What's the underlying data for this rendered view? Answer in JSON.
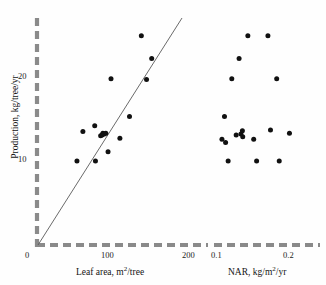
{
  "figure": {
    "background_color": "#fefefe",
    "axis_color": "#8a8a8a",
    "point_color": "#111111",
    "line_color": "#555555"
  },
  "yaxis": {
    "label_prefix": "Production, kg/tree/yr",
    "ticks": [
      {
        "value": 10,
        "label": "10"
      },
      {
        "value": 20,
        "label": "20"
      }
    ],
    "range": [
      0,
      27
    ]
  },
  "chart_data": [
    {
      "type": "scatter",
      "panel": "left",
      "title": "",
      "xlabel_text": "Leaf area, m",
      "xlabel_sup": "2",
      "xlabel_tail": "/tree",
      "xlabel": "Leaf area, m2/tree",
      "ylabel": "Production, kg/tree/yr",
      "xlim": [
        0,
        215
      ],
      "ylim": [
        0,
        27
      ],
      "xticks": [
        0,
        100,
        200
      ],
      "xtick_labels": [
        "0",
        "100",
        "200"
      ],
      "yticks": [
        10,
        20
      ],
      "ytick_labels": [
        "10",
        "20"
      ],
      "grid": false,
      "legend": "none",
      "fit_line": {
        "type": "line",
        "through_origin": true,
        "x0": 0,
        "y0": 0,
        "x1": 160,
        "y1": 26.5
      },
      "points": [
        {
          "x": 54,
          "y": 10.0
        },
        {
          "x": 62,
          "y": 13.5
        },
        {
          "x": 78,
          "y": 14.2
        },
        {
          "x": 79,
          "y": 10.0
        },
        {
          "x": 86,
          "y": 13.0
        },
        {
          "x": 88,
          "y": 13.1
        },
        {
          "x": 89,
          "y": 13.3
        },
        {
          "x": 91,
          "y": 13.2
        },
        {
          "x": 93,
          "y": 13.3
        },
        {
          "x": 96,
          "y": 11.1
        },
        {
          "x": 100,
          "y": 19.8
        },
        {
          "x": 112,
          "y": 12.7
        },
        {
          "x": 125,
          "y": 15.3
        },
        {
          "x": 141,
          "y": 24.9
        },
        {
          "x": 148,
          "y": 19.7
        },
        {
          "x": 155,
          "y": 22.2
        }
      ]
    },
    {
      "type": "scatter",
      "panel": "right",
      "title": "",
      "xlabel_text": "NAR, kg/m",
      "xlabel_sup": "2",
      "xlabel_tail": "/yr",
      "xlabel": "NAR, kg/m2/yr",
      "ylabel": "Production, kg/tree/yr",
      "xlim": [
        0.092,
        0.228
      ],
      "ylim": [
        0,
        27
      ],
      "xticks": [
        0.1,
        0.2
      ],
      "xtick_labels": [
        "0.1",
        "0.2"
      ],
      "yticks": [
        10,
        20
      ],
      "ytick_labels": [
        "10",
        "20"
      ],
      "grid": false,
      "legend": "none",
      "points": [
        {
          "x": 0.1095,
          "y": 12.6
        },
        {
          "x": 0.113,
          "y": 15.3
        },
        {
          "x": 0.1145,
          "y": 12.2
        },
        {
          "x": 0.118,
          "y": 10.0
        },
        {
          "x": 0.123,
          "y": 19.8
        },
        {
          "x": 0.129,
          "y": 13.1
        },
        {
          "x": 0.133,
          "y": 22.2
        },
        {
          "x": 0.1355,
          "y": 13.2
        },
        {
          "x": 0.1375,
          "y": 13.6
        },
        {
          "x": 0.138,
          "y": 12.9
        },
        {
          "x": 0.145,
          "y": 24.9
        },
        {
          "x": 0.153,
          "y": 12.6
        },
        {
          "x": 0.157,
          "y": 10.0
        },
        {
          "x": 0.1725,
          "y": 24.9
        },
        {
          "x": 0.176,
          "y": 13.7
        },
        {
          "x": 0.1845,
          "y": 19.8
        },
        {
          "x": 0.188,
          "y": 10.0
        },
        {
          "x": 0.202,
          "y": 13.3
        }
      ]
    }
  ]
}
